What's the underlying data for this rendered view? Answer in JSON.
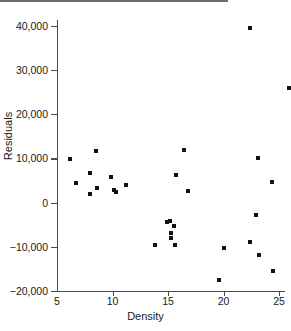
{
  "chart_data": {
    "type": "scatter",
    "title": "",
    "xlabel": "Density",
    "ylabel": "Residuals",
    "xlim": [
      5,
      26.5
    ],
    "ylim": [
      -20000,
      40000
    ],
    "grid": false,
    "legend": null,
    "reference_line": {
      "axis": "y",
      "value": 0
    },
    "xticks": [
      5,
      10,
      15,
      20,
      25
    ],
    "xtick_labels": [
      "5",
      "10",
      "15",
      "20",
      "25"
    ],
    "yticks": [
      -20000,
      -10000,
      0,
      10000,
      20000,
      30000,
      40000
    ],
    "ytick_labels": [
      "−20,000",
      "−10,000",
      "0",
      "10,000",
      "20,000",
      "30,000",
      "40,000"
    ],
    "series": [
      {
        "name": "residuals",
        "marker": "square",
        "color": "#121212",
        "points": [
          {
            "x": 6.2,
            "y": 9800
          },
          {
            "x": 6.7,
            "y": 4500
          },
          {
            "x": 8.0,
            "y": 6600
          },
          {
            "x": 8.0,
            "y": 2000
          },
          {
            "x": 8.5,
            "y": 11700
          },
          {
            "x": 8.6,
            "y": 3200
          },
          {
            "x": 9.9,
            "y": 5900
          },
          {
            "x": 10.1,
            "y": 2900
          },
          {
            "x": 10.3,
            "y": 2500
          },
          {
            "x": 11.2,
            "y": 3900
          },
          {
            "x": 13.8,
            "y": -9700
          },
          {
            "x": 14.9,
            "y": -4500
          },
          {
            "x": 15.2,
            "y": -4200
          },
          {
            "x": 15.3,
            "y": -8000
          },
          {
            "x": 15.3,
            "y": -6800
          },
          {
            "x": 15.5,
            "y": -5200
          },
          {
            "x": 15.6,
            "y": -9700
          },
          {
            "x": 15.7,
            "y": 6200
          },
          {
            "x": 16.4,
            "y": 12000
          },
          {
            "x": 16.8,
            "y": 2700
          },
          {
            "x": 19.6,
            "y": -17400
          },
          {
            "x": 20.0,
            "y": -10200
          },
          {
            "x": 22.4,
            "y": 39500
          },
          {
            "x": 22.4,
            "y": -8900
          },
          {
            "x": 22.9,
            "y": -2700
          },
          {
            "x": 23.1,
            "y": 10000
          },
          {
            "x": 23.2,
            "y": -11800
          },
          {
            "x": 24.4,
            "y": 4600
          },
          {
            "x": 24.5,
            "y": -15500
          },
          {
            "x": 25.9,
            "y": 26000
          }
        ]
      }
    ]
  }
}
